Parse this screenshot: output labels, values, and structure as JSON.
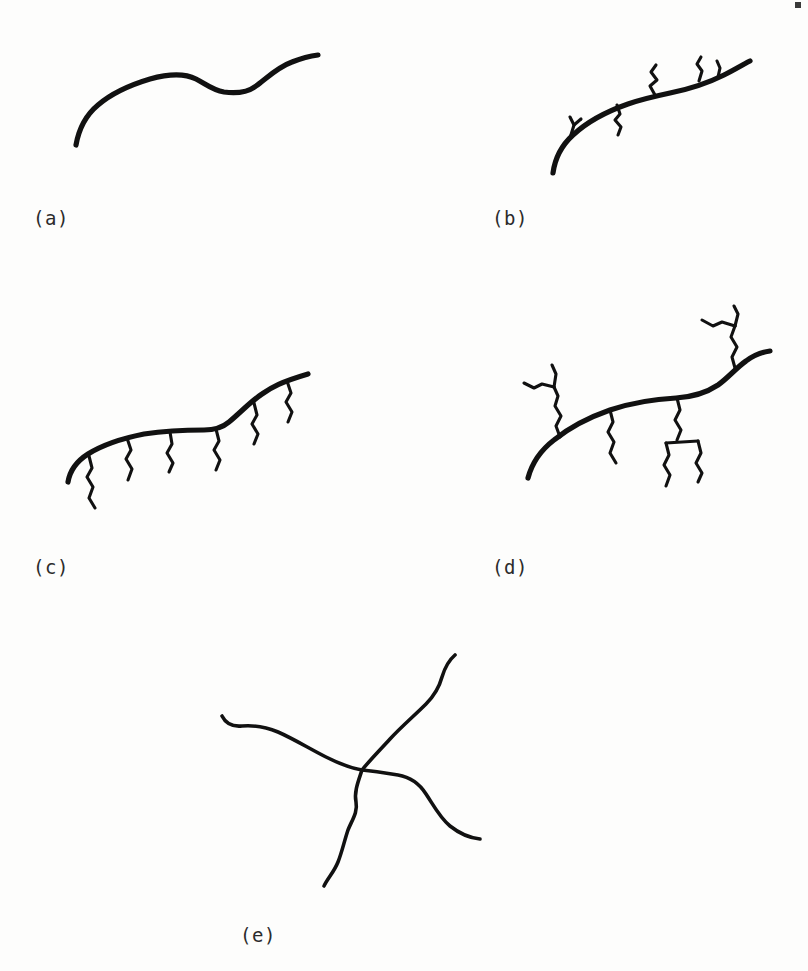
{
  "figure": {
    "background_color": "#fdfdfc",
    "ink_color": "#111111",
    "width": 808,
    "height": 971,
    "panel_count": 5
  },
  "panels": [
    {
      "id": "a",
      "label": "(a)",
      "architecture": "linear",
      "label_x": 33,
      "label_y": 207,
      "region_x": 0,
      "region_y": 0,
      "region_w": 404,
      "region_h": 200,
      "backbone_count": 1,
      "branch_count": 0
    },
    {
      "id": "b",
      "label": "(b)",
      "architecture": "short-branched",
      "label_x": 492,
      "label_y": 207,
      "region_x": 470,
      "region_y": 20,
      "region_w": 338,
      "region_h": 180,
      "backbone_count": 1,
      "branch_count": 5
    },
    {
      "id": "c",
      "label": "(c)",
      "architecture": "comb",
      "label_x": 33,
      "label_y": 556,
      "region_x": 20,
      "region_y": 370,
      "region_w": 350,
      "region_h": 170,
      "backbone_count": 1,
      "branch_count": 6
    },
    {
      "id": "d",
      "label": "(d)",
      "architecture": "randomly-branched",
      "label_x": 492,
      "label_y": 556,
      "region_x": 470,
      "region_y": 310,
      "region_w": 338,
      "region_h": 230,
      "backbone_count": 1,
      "branch_count": 5
    },
    {
      "id": "e",
      "label": "(e)",
      "architecture": "star",
      "label_x": 240,
      "label_y": 934,
      "region_x": 200,
      "region_y": 630,
      "region_w": 320,
      "region_h": 250,
      "backbone_count": 0,
      "branch_count": 4
    }
  ],
  "marks": {
    "corner_speck": {
      "x": 795,
      "y": 2,
      "w": 6,
      "h": 6
    }
  }
}
